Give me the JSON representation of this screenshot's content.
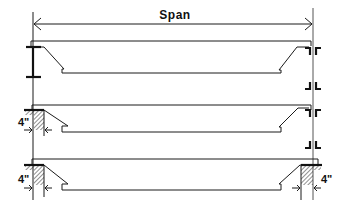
{
  "diagram": {
    "span_label": "Span",
    "dimension_labels": {
      "bearing_row2_left": "4\"",
      "bearing_row3_left": "4\"",
      "bearing_row3_right": "4\""
    },
    "rows": [
      {
        "name": "steel-beam-connection-both-ends",
        "left_support": "steel flange",
        "right_support": "steel clip angles"
      },
      {
        "name": "masonry-bearing-left-steel-right",
        "left_support": "masonry wall 4\" bearing",
        "right_support": "steel clip angles"
      },
      {
        "name": "masonry-bearing-both-ends",
        "left_support": "masonry wall 4\" bearing",
        "right_support": "masonry wall 4\" bearing"
      }
    ],
    "colors": {
      "line": "#1a1a1a",
      "background": "#ffffff"
    }
  }
}
